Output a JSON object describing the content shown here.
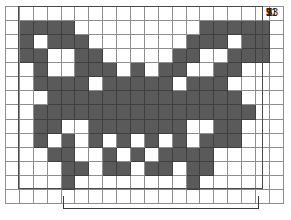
{
  "chart_data": {
    "type": "heatmap",
    "title": "",
    "subtitle": "",
    "xlabel": "",
    "ylabel": "",
    "grid": {
      "columns": 20,
      "rows": 14,
      "filled_color": "#5a5a5a",
      "empty_color": "#ffffff",
      "gridline_color": "#8e8e8e",
      "frame_color": "#4a4a4a"
    },
    "row_labels": [
      "13",
      "11",
      "9",
      "7",
      "5",
      "3",
      "1"
    ],
    "row_label_rows": [
      13,
      11,
      9,
      7,
      5,
      3,
      1
    ],
    "legend": [],
    "cells": [
      [
        0,
        0,
        0,
        0,
        0,
        0,
        0,
        0,
        0,
        0,
        0,
        0,
        0,
        0,
        0,
        0,
        0,
        0,
        0,
        0
      ],
      [
        0,
        1,
        1,
        1,
        1,
        0,
        0,
        0,
        0,
        0,
        0,
        0,
        0,
        0,
        1,
        1,
        1,
        1,
        1,
        0
      ],
      [
        0,
        1,
        0,
        1,
        1,
        1,
        0,
        0,
        0,
        0,
        0,
        0,
        0,
        1,
        1,
        1,
        0,
        1,
        1,
        0
      ],
      [
        0,
        1,
        1,
        0,
        0,
        1,
        1,
        0,
        0,
        0,
        0,
        0,
        1,
        1,
        0,
        0,
        1,
        1,
        1,
        0
      ],
      [
        0,
        0,
        1,
        0,
        0,
        1,
        1,
        1,
        0,
        1,
        0,
        1,
        1,
        0,
        0,
        1,
        1,
        0,
        0,
        0
      ],
      [
        0,
        0,
        1,
        1,
        1,
        1,
        0,
        1,
        1,
        1,
        1,
        1,
        0,
        1,
        1,
        1,
        0,
        0,
        0,
        0
      ],
      [
        0,
        0,
        0,
        1,
        1,
        1,
        1,
        1,
        1,
        1,
        1,
        1,
        1,
        1,
        1,
        1,
        1,
        0,
        0,
        0
      ],
      [
        0,
        0,
        1,
        1,
        1,
        1,
        1,
        1,
        1,
        1,
        1,
        1,
        1,
        1,
        1,
        1,
        1,
        1,
        0,
        0
      ],
      [
        0,
        0,
        1,
        1,
        0,
        0,
        1,
        1,
        1,
        1,
        1,
        1,
        1,
        0,
        0,
        1,
        1,
        0,
        0,
        0
      ],
      [
        0,
        0,
        1,
        0,
        1,
        0,
        1,
        0,
        1,
        0,
        1,
        0,
        1,
        0,
        1,
        1,
        1,
        0,
        0,
        0
      ],
      [
        0,
        0,
        0,
        1,
        1,
        0,
        0,
        1,
        0,
        1,
        0,
        1,
        1,
        1,
        1,
        0,
        0,
        0,
        0,
        0
      ],
      [
        0,
        0,
        0,
        0,
        1,
        1,
        0,
        1,
        1,
        0,
        1,
        1,
        0,
        1,
        1,
        0,
        0,
        0,
        0,
        0
      ],
      [
        0,
        0,
        0,
        0,
        1,
        0,
        0,
        0,
        0,
        0,
        0,
        0,
        0,
        1,
        0,
        0,
        0,
        0,
        0,
        0
      ],
      [
        0,
        0,
        0,
        0,
        0,
        0,
        0,
        0,
        0,
        0,
        0,
        0,
        0,
        0,
        0,
        0,
        0,
        0,
        0,
        0
      ]
    ]
  },
  "bracket": {
    "caption": ""
  }
}
